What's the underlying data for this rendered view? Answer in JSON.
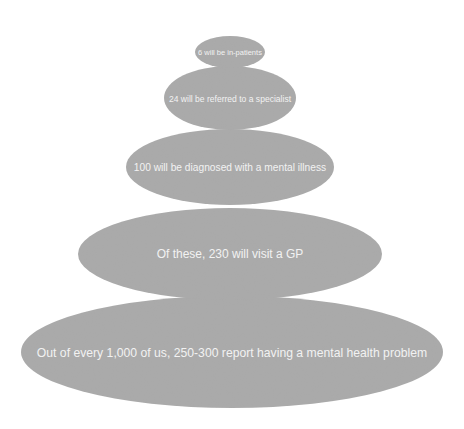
{
  "diagram": {
    "title": "",
    "fill_color": "#a9a9a9",
    "text_color": "#f2f2f2",
    "levels": [
      {
        "id": "in-patients",
        "label": "6 will be in-patients",
        "value": 6
      },
      {
        "id": "specialist",
        "label": "24 will be referred to a specialist",
        "value": 24
      },
      {
        "id": "diagnosed",
        "label": "100 will be diagnosed with a mental illness",
        "value": 100
      },
      {
        "id": "gp",
        "label": "Of these, 230 will visit a GP",
        "value": 230
      },
      {
        "id": "report",
        "label": "Out of every 1,000 of us, 250-300 report having a mental health problem",
        "value": "250-300"
      }
    ]
  }
}
